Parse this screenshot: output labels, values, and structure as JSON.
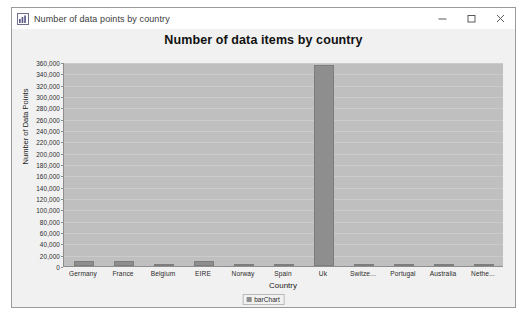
{
  "window": {
    "title": "Number of data points by country",
    "icon": "chart-window-icon",
    "controls": {
      "minimize": "minimize-icon",
      "maximize": "maximize-icon",
      "close": "close-icon"
    }
  },
  "chart_data": {
    "type": "bar",
    "title": "Number of data items by country",
    "xlabel": "Country",
    "ylabel": "Number of Data Points",
    "categories": [
      "Germany",
      "France",
      "Belgium",
      "EIRE",
      "Norway",
      "Spain",
      "Uk",
      "Switze...",
      "Portugal",
      "Australia",
      "Nethe..."
    ],
    "values": [
      9495,
      8557,
      2069,
      8196,
      1086,
      2533,
      354345,
      2002,
      1519,
      1259,
      2371
    ],
    "series": [
      {
        "name": "barChart",
        "values": [
          9495,
          8557,
          2069,
          8196,
          1086,
          2533,
          354345,
          2002,
          1519,
          1259,
          2371
        ]
      }
    ],
    "ylim": [
      0,
      360000
    ],
    "ytick_labels": [
      "0",
      "20,000",
      "40,000",
      "60,000",
      "80,000",
      "100,000",
      "120,000",
      "140,000",
      "160,000",
      "180,000",
      "200,000",
      "220,000",
      "240,000",
      "260,000",
      "280,000",
      "300,000",
      "320,000",
      "340,000",
      "360,000"
    ],
    "ytick_values": [
      0,
      20000,
      40000,
      60000,
      80000,
      100000,
      120000,
      140000,
      160000,
      180000,
      200000,
      220000,
      240000,
      260000,
      280000,
      300000,
      320000,
      340000,
      360000
    ],
    "grid": true,
    "legend": {
      "position": "bottom",
      "entries": [
        "barChart"
      ]
    },
    "colors": {
      "bar": "#8e8e8e",
      "plot_background": "#bfbfbf",
      "chart_background": "#f1f1f1"
    }
  }
}
